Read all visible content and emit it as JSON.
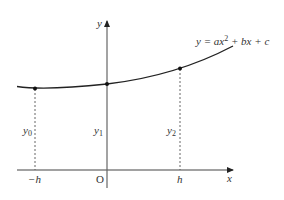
{
  "diagram": {
    "equation": {
      "prefix": "y = ax",
      "exponent": "2",
      "suffix": " + bx + c"
    },
    "axes": {
      "x_label": "x",
      "y_label": "y",
      "origin_label": "O"
    },
    "ticks": {
      "neg_h": "−h",
      "pos_h": "h"
    },
    "ordinates": [
      {
        "name": "y",
        "sub": "0"
      },
      {
        "name": "y",
        "sub": "1"
      },
      {
        "name": "y",
        "sub": "2"
      }
    ],
    "colors": {
      "axis": "#555555",
      "curve": "#222222",
      "dashed": "#555555",
      "text": "#333333"
    }
  }
}
